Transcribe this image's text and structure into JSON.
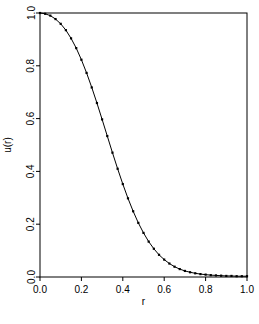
{
  "figure": {
    "background_color": "#ffffff",
    "foreground_color": "#000000",
    "width": 259,
    "height": 324
  },
  "axes": {
    "box": {
      "left": 40,
      "top": 13,
      "right": 247,
      "bottom": 277
    },
    "x_axis": {
      "label": "r",
      "ticks": [
        "0.0",
        "0.2",
        "0.4",
        "0.6",
        "0.8",
        "1.0"
      ],
      "tick_values": [
        0.0,
        0.2,
        0.4,
        0.6,
        0.8,
        1.0
      ],
      "range": [
        0.0,
        1.0
      ]
    },
    "y_axis": {
      "label": "u(r)",
      "ticks": [
        "0.0",
        "0.2",
        "0.4",
        "0.6",
        "0.8",
        "1.0"
      ],
      "tick_values": [
        0.0,
        0.2,
        0.4,
        0.6,
        0.8,
        1.0
      ],
      "range": [
        0.0,
        1.0
      ]
    }
  },
  "chart_data": {
    "type": "line",
    "title": "",
    "subtitle": "",
    "xlabel": "r",
    "ylabel": "u(r)",
    "xlim": [
      0.0,
      1.0
    ],
    "ylim": [
      0.0,
      1.0
    ],
    "grid": false,
    "legend": null,
    "annotations": [],
    "marker": "filled-square",
    "marker_size": 2.2,
    "line_color": "#000000",
    "line_width": 1.0,
    "series": [
      {
        "name": "u(r)",
        "color": "#000000",
        "x": [
          0.0,
          0.025,
          0.05,
          0.075,
          0.1,
          0.125,
          0.15,
          0.175,
          0.2,
          0.225,
          0.25,
          0.275,
          0.3,
          0.325,
          0.35,
          0.375,
          0.4,
          0.425,
          0.45,
          0.475,
          0.5,
          0.525,
          0.55,
          0.575,
          0.6,
          0.625,
          0.65,
          0.675,
          0.7,
          0.725,
          0.75,
          0.775,
          0.8,
          0.825,
          0.85,
          0.875,
          0.9,
          0.925,
          0.95,
          0.975,
          1.0
        ],
        "y": [
          1.0,
          0.997,
          0.99,
          0.977,
          0.959,
          0.935,
          0.904,
          0.867,
          0.823,
          0.773,
          0.718,
          0.659,
          0.597,
          0.534,
          0.471,
          0.41,
          0.352,
          0.298,
          0.249,
          0.205,
          0.167,
          0.134,
          0.107,
          0.084,
          0.066,
          0.051,
          0.039,
          0.03,
          0.023,
          0.018,
          0.014,
          0.011,
          0.009,
          0.007,
          0.006,
          0.005,
          0.004,
          0.004,
          0.003,
          0.003,
          0.003
        ]
      }
    ]
  }
}
